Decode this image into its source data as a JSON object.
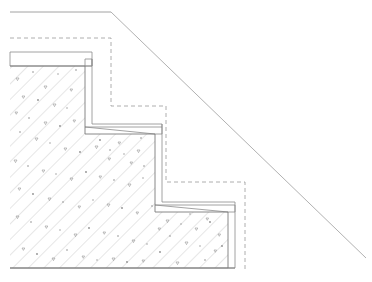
{
  "drawing": {
    "title": "Stepped Concrete Section",
    "type": "cad-section-drawing",
    "canvas": {
      "width": 372,
      "height": 282,
      "background": "#ffffff"
    },
    "colors": {
      "solid_line": "#8c8c8c",
      "dashed_line": "#9a9a9a",
      "slope_line": "#9d9d9d",
      "hatch_line": "#a6a6a6",
      "aggregate": "#8e8e8e",
      "background": "#ffffff"
    },
    "line_styles": {
      "solid": "continuous",
      "dashed": "4-3 dash",
      "hatch": "45-degree concrete hatch with aggregate"
    }
  },
  "geometry": {
    "top_reference_line": {
      "name": "top-horizontal-reference",
      "points": "10,12 111,12"
    },
    "slope_line": {
      "name": "diagonal-slope-line",
      "points": "111,12 366,258",
      "description": "grade slope from top-left step crown down to lower right"
    },
    "dashed_offset_profile": {
      "name": "dashed-offset-profile",
      "points": "10,38 111,38 111,106 166,106 166,182 245,182 245,272",
      "description": "dashed offset reference following the stepped profile"
    },
    "upper_ledge_rectangle": {
      "name": "upper-ledge-rectangle",
      "points": "10,52 92,52 92,66 10,66"
    },
    "concrete_outline": {
      "name": "concrete-body-outline",
      "points": "10,66 85,66 85,134 155,134 155,212 228,212 228,268 10,268",
      "description": "main hatched concrete body with two steps"
    },
    "step_nosing_1": {
      "name": "step-nosing-upper",
      "points": "85,59 92,59 92,66 85,66",
      "description": "small nosing lip at first step crown"
    },
    "step_nosing_2": {
      "name": "step-nosing-middle",
      "points": "85,127 162,127 162,134 155,134",
      "description": "nosing lip along the first tread"
    },
    "step_nosing_3": {
      "name": "step-nosing-lower",
      "points": "155,205 235,205 235,212 228,212",
      "description": "nosing lip along the second tread"
    },
    "riser_outline_1": {
      "name": "riser-outline-upper",
      "points": "92,59 92,124 162,124 162,127"
    },
    "riser_outline_2": {
      "name": "riser-outline-lower",
      "points": "162,124 162,202 235,202 235,205"
    },
    "right_closure": {
      "name": "right-closure-line",
      "points": "235,205 235,268 228,268"
    },
    "bottom_edge": {
      "name": "bottom-edge-line",
      "points": "10,268 235,268"
    }
  },
  "hatch": {
    "name": "concrete-hatch",
    "angle_degrees": 45,
    "direction": "down-right",
    "spacing_px": 11,
    "aggregate_count": 96,
    "label": "concrete"
  },
  "labels": {
    "none_visible": ""
  }
}
